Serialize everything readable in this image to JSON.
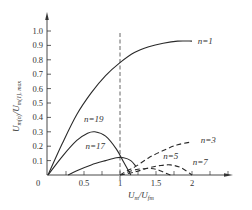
{
  "chart_data": {
    "type": "line",
    "title": "",
    "xlabel": "U_m / U_fm",
    "ylabel": "U_m(n) / U_m(1), max",
    "xlim": [
      0,
      2.55
    ],
    "ylim": [
      0,
      1.05
    ],
    "grid": false,
    "legend": "inline labels",
    "x_ticks": [
      "0.5",
      "1",
      "1.5",
      "2"
    ],
    "x_origin_label": "0",
    "y_ticks": [
      "0.1",
      "0.2",
      "0.3",
      "0.4",
      "0.5",
      "0.6",
      "0.7",
      "0.8",
      "0.9",
      "1.0"
    ],
    "reference_line": {
      "x": 1.0,
      "style": "dashed",
      "orientation": "vertical"
    },
    "series": [
      {
        "name": "n=1",
        "style": "solid",
        "x": [
          0,
          0.2,
          0.4,
          0.6,
          0.8,
          1.0,
          1.2,
          1.4,
          1.6,
          1.8,
          2.0
        ],
        "y": [
          0,
          0.22,
          0.42,
          0.57,
          0.69,
          0.78,
          0.85,
          0.89,
          0.915,
          0.93,
          0.93
        ]
      },
      {
        "name": "n=19",
        "style": "solid",
        "x": [
          0,
          0.2,
          0.4,
          0.55,
          0.65,
          0.8,
          0.95,
          1.05,
          1.15
        ],
        "y": [
          0,
          0.13,
          0.24,
          0.29,
          0.3,
          0.27,
          0.18,
          0.09,
          0.0
        ]
      },
      {
        "name": "n=17",
        "style": "solid",
        "x": [
          0.28,
          0.4,
          0.6,
          0.8,
          0.95,
          1.05,
          1.15,
          1.22
        ],
        "y": [
          0.0,
          0.03,
          0.07,
          0.1,
          0.12,
          0.12,
          0.1,
          0.06
        ]
      },
      {
        "name": "n=3",
        "style": "dashed",
        "x": [
          1.0,
          1.1,
          1.22,
          1.4,
          1.6,
          1.8,
          2.0
        ],
        "y": [
          0.0,
          0.03,
          0.06,
          0.12,
          0.17,
          0.21,
          0.23
        ]
      },
      {
        "name": "n=5",
        "style": "dashed",
        "x": [
          1.0,
          1.2,
          1.4,
          1.55,
          1.7,
          1.85,
          2.0
        ],
        "y": [
          0.0,
          0.02,
          0.05,
          0.065,
          0.07,
          0.05,
          0.0
        ]
      },
      {
        "name": "n=7",
        "style": "dashed",
        "x": [
          1.1,
          1.25,
          1.4,
          1.5,
          1.6,
          1.7
        ],
        "y": [
          0.02,
          0.04,
          0.045,
          0.04,
          0.02,
          0.0
        ]
      }
    ],
    "annotations": [
      {
        "text": "n=1",
        "x": 2.08,
        "y": 0.93
      },
      {
        "text": "n=19",
        "x": 0.5,
        "y": 0.39
      },
      {
        "text": "n=17",
        "x": 0.52,
        "y": 0.2
      },
      {
        "text": "n=3",
        "x": 2.12,
        "y": 0.24
      },
      {
        "text": "n=5",
        "x": 1.6,
        "y": 0.13
      },
      {
        "text": "n=7",
        "x": 2.01,
        "y": 0.09
      }
    ]
  },
  "labels": {
    "origin": "0",
    "x_title_main": "U",
    "x_title_sub1": "m",
    "x_title_slash": "/U",
    "x_title_sub2": "fm",
    "y_title_main": "U",
    "y_title_sub1": "m(n)",
    "y_title_slash": "/U",
    "y_title_sub2": "m(1), max"
  }
}
